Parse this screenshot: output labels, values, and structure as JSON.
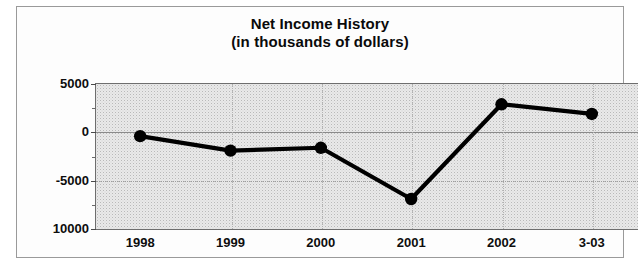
{
  "chart_data": {
    "type": "line",
    "title": "Net Income History",
    "subtitle": "(in thousands of dollars)",
    "xlabel": "",
    "ylabel": "",
    "categories": [
      "1998",
      "1999",
      "2000",
      "2001",
      "2002",
      "3-03"
    ],
    "values": [
      -500,
      -2000,
      -1700,
      -7000,
      2800,
      1800
    ],
    "series": [
      {
        "name": "Net Income",
        "values": [
          -500,
          -2000,
          -1700,
          -7000,
          2800,
          1800
        ]
      }
    ],
    "ylim": [
      -10000,
      5000
    ],
    "ytick_labels": [
      "5000",
      "0",
      "-5000",
      "10000"
    ],
    "ytick_values": [
      5000,
      0,
      -5000,
      -10000
    ],
    "yminor_values": [
      2500,
      -2500,
      -7500
    ],
    "grid": true,
    "legend": "none",
    "line_color": "#000000",
    "marker": "circle",
    "marker_color": "#000000",
    "plot_background": "#e9e9e9",
    "frame_color": "#9a9a9a"
  },
  "chart": {
    "title_line1": "Net Income History",
    "title_line2": "(in thousands of dollars)"
  }
}
